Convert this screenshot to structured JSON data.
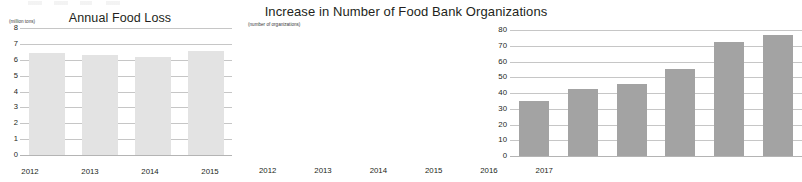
{
  "chart_data": [
    {
      "type": "bar",
      "id": "annual-food-loss",
      "title": "Annual Food Loss",
      "ylabel": "(million tons)",
      "xlabel": "",
      "categories": [
        "2012",
        "2013",
        "2014",
        "2015"
      ],
      "values": [
        6.4,
        6.3,
        6.2,
        6.55
      ],
      "ylim": [
        0,
        8
      ],
      "yticks": [
        8,
        7,
        6,
        5,
        4,
        3,
        2,
        1,
        0
      ],
      "grid": true,
      "legend": "none",
      "bar_color": "#e3e3e3"
    },
    {
      "type": "bar",
      "id": "food-bank-organizations",
      "title": "Increase in Number of Food Bank Organizations",
      "ylabel": "(number of organizations)",
      "xlabel": "",
      "categories": [
        "2012",
        "2013",
        "2014",
        "2015",
        "2016",
        "2017"
      ],
      "values": [
        35,
        42.5,
        45.5,
        55,
        72.5,
        77
      ],
      "ylim": [
        0,
        80
      ],
      "yticks": [
        80,
        70,
        60,
        50,
        40,
        30,
        20,
        10,
        0
      ],
      "grid": true,
      "legend": "none",
      "bar_color": "#a3a3a3"
    }
  ]
}
